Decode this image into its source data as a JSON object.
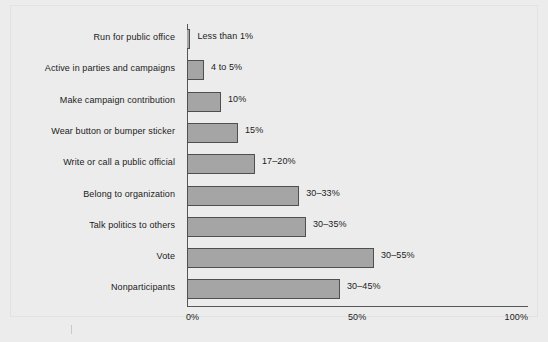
{
  "chart_data": {
    "type": "bar",
    "orientation": "horizontal",
    "title": "",
    "xlabel": "",
    "ylabel": "",
    "xlim": [
      0,
      100
    ],
    "grid": false,
    "legend": null,
    "tick_labels": [
      "0%",
      "50%",
      "100%"
    ],
    "tick_values": [
      0,
      50,
      100
    ],
    "categories": [
      "Run for public office",
      "Active in parties and campaigns",
      "Make campaign contribution",
      "Wear button or bumper sticker",
      "Write or call a public official",
      "Belong to organization",
      "Talk politics to others",
      "Vote",
      "Nonparticipants"
    ],
    "values": [
      1,
      5,
      10,
      15,
      20,
      33,
      35,
      55,
      45
    ],
    "value_labels": [
      "Less than 1%",
      "4 to 5%",
      "10%",
      "15%",
      "17–20%",
      "30–33%",
      "30–35%",
      "30–55%",
      "30–45%"
    ]
  },
  "style": {
    "background": "#ececec",
    "bar_fill": "#a5a5a5",
    "bar_stroke": "#4f4f4f",
    "axis_color": "#565656",
    "text_color": "#1b1b1b"
  }
}
